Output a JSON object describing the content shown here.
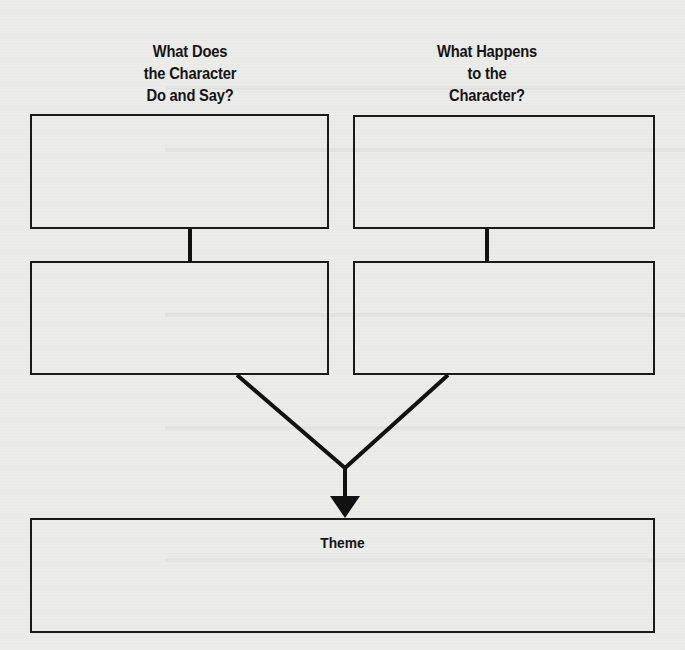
{
  "diagram": {
    "type": "character-theme-organizer",
    "columns": [
      {
        "heading_lines": [
          "What Does",
          "the Character",
          "Do and Say?"
        ],
        "boxes": [
          "",
          ""
        ]
      },
      {
        "heading_lines": [
          "What Happens",
          "to the",
          "Character?"
        ],
        "boxes": [
          "",
          ""
        ]
      }
    ],
    "result_box": {
      "label": "Theme",
      "content": ""
    },
    "connectors": [
      {
        "from": "left-box-1",
        "to": "left-box-2",
        "type": "line"
      },
      {
        "from": "right-box-1",
        "to": "right-box-2",
        "type": "line"
      },
      {
        "from": "left-box-2",
        "to": "theme-box",
        "type": "merge-arrow"
      },
      {
        "from": "right-box-2",
        "to": "theme-box",
        "type": "merge-arrow"
      }
    ],
    "colors": {
      "paper": "#ebebea",
      "ink": "#141414"
    }
  }
}
